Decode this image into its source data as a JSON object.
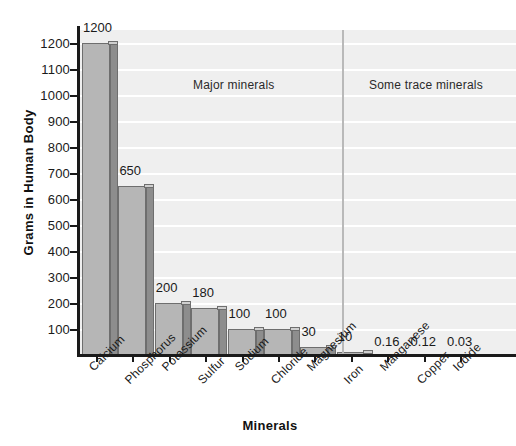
{
  "chart_data": {
    "type": "bar",
    "title": "",
    "xlabel": "Minerals",
    "ylabel": "Grams in Human Body",
    "categories": [
      "Calcium",
      "Phosphorus",
      "Potassium",
      "Sulfur",
      "Sodium",
      "Chloride",
      "Magnesium",
      "Iron",
      "Manganese",
      "Copper",
      "Iodide"
    ],
    "values": [
      1200,
      650,
      200,
      180,
      100,
      100,
      30,
      10,
      0.16,
      0.12,
      0.03
    ],
    "value_labels": [
      "1200",
      "650",
      "200",
      "180",
      "100",
      "100",
      "30",
      "10",
      "0.16",
      "0.12",
      "0.03"
    ],
    "ylim": [
      0,
      1250
    ],
    "y_ticks": [
      100,
      200,
      300,
      400,
      500,
      600,
      700,
      800,
      900,
      1000,
      1100,
      1200
    ],
    "y_tick_labels": [
      "100",
      "200",
      "300",
      "400",
      "500",
      "600",
      "700",
      "800",
      "900",
      "1000",
      "1100",
      "1200"
    ],
    "grid": "horizontal",
    "legend": "none",
    "annotations": [
      {
        "text": "Major minerals",
        "group": "major"
      },
      {
        "text": "Some trace minerals",
        "group": "trace"
      }
    ],
    "group_divider_after": "Magnesium",
    "colors": {
      "bar_front": "#b6b6b6",
      "bar_side": "#8d8d8d",
      "bar_top": "#cfcfcf",
      "bar_outline": "#6e6e6e",
      "plot_background": "#efefef",
      "gridline": "#ffffff",
      "axis": "#1a1a1a",
      "divider": "#b9b9b9"
    }
  }
}
